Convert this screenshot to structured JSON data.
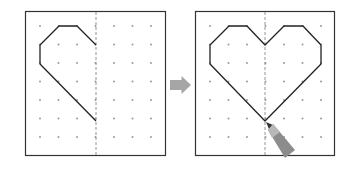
{
  "diagram": {
    "colors": {
      "frame": "#333333",
      "dot": "#9a9a9a",
      "axis": "#888888",
      "line": "#222222",
      "arrow": "#a6a6a6",
      "pencil_body": "#8c8c8c",
      "pencil_light": "#b8b8b8"
    },
    "grid": {
      "cols": 7,
      "rows": 7,
      "spacing": 18.5
    },
    "panels": [
      {
        "name": "half-heart-panel",
        "x": 25,
        "y": 11,
        "w": 140,
        "h": 144,
        "axis_x": 96,
        "dot_x0": 40,
        "dot_y0": 26,
        "path": "96,45 77,26 59,26 40,45 40,64 96,121",
        "closed": false
      },
      {
        "name": "full-heart-panel",
        "x": 195,
        "y": 11,
        "w": 139,
        "h": 144,
        "axis_x": 265,
        "dot_x0": 210,
        "dot_y0": 26,
        "path": "265,45 284,26 303,26 321,45 321,64 265,121 210,64 210,45 229,26 247,26",
        "closed": true
      }
    ],
    "arrow": {
      "x": 170,
      "y": 76,
      "w": 21,
      "h": 18
    }
  }
}
